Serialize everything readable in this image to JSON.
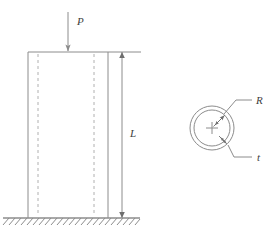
{
  "figure": {
    "stroke_color": "#8c8c8c",
    "label_color": "#3d3d3d",
    "background_color": "#ffffff"
  },
  "labels": {
    "load": "P",
    "length": "L",
    "radius": "R",
    "thickness": "t"
  },
  "elevation": {
    "name": "column-elevation",
    "column_left_x": 28,
    "column_right_x": 108,
    "column_top_y": 52,
    "column_bottom_y": 218,
    "hidden_line_left_x": 38,
    "hidden_line_right_x": 94,
    "load_arrow_x": 68,
    "load_arrow_top_y": 12,
    "load_arrow_tip_y": 51,
    "dimension_line_x": 122,
    "extension_line_right_x": 141,
    "ground_line_y": 218,
    "ground_left_x": 3,
    "ground_right_x": 140
  },
  "cross_section": {
    "name": "cross-section-detail",
    "center_x": 212,
    "center_y": 128,
    "outer_radius": 22,
    "inner_radius": 18,
    "center_mark_size": 6,
    "radius_leader_label_x": 258,
    "radius_leader_label_y": 101,
    "thickness_leader_label_x": 258,
    "thickness_leader_label_y": 158
  }
}
